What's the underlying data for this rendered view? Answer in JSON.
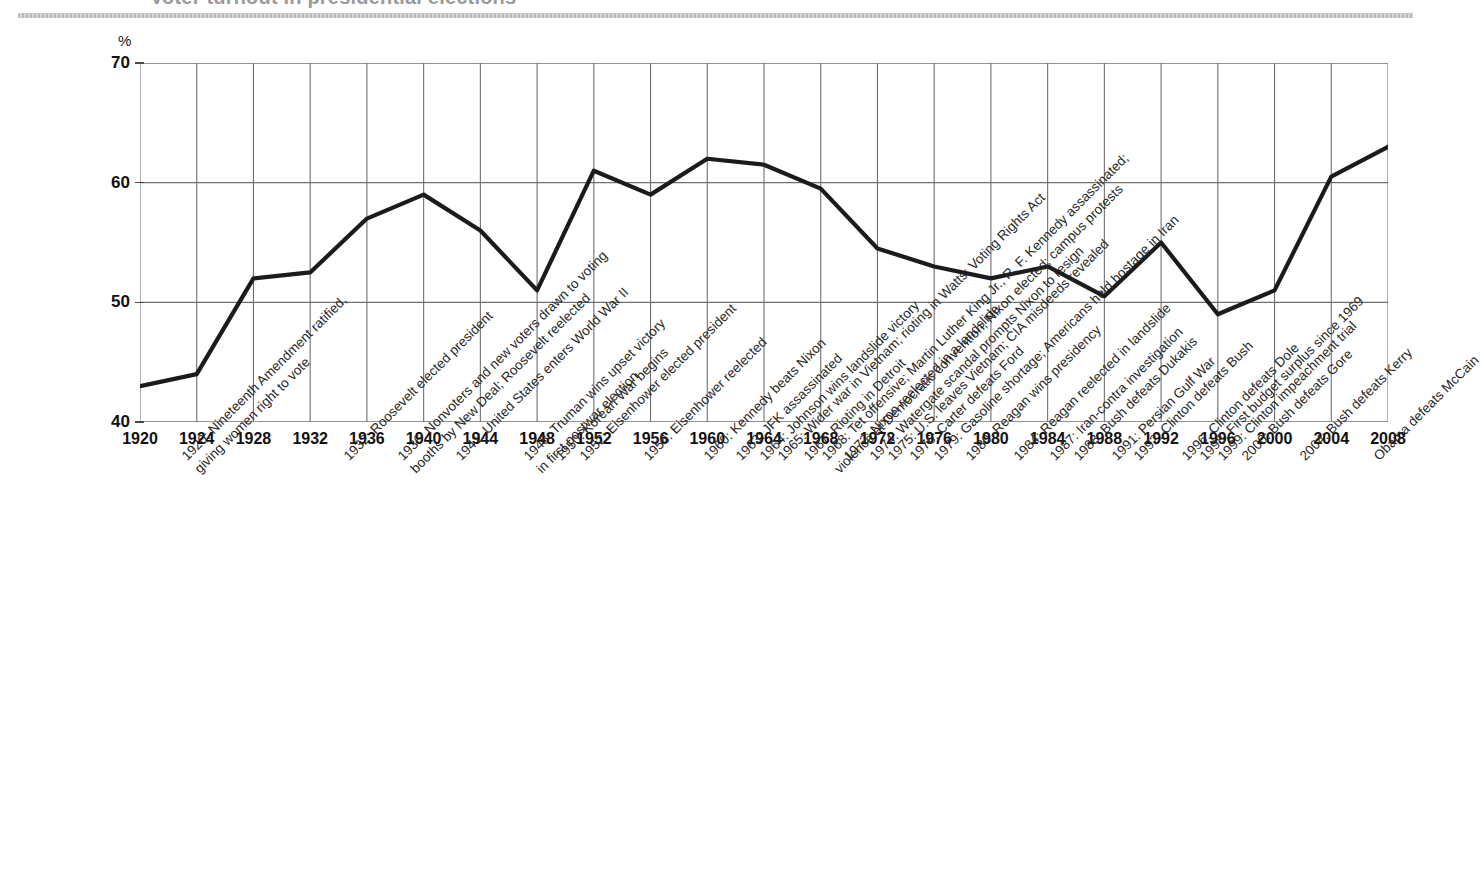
{
  "page": {
    "cut_title": "Voter turnout in presidential elections",
    "y_axis_unit": "%"
  },
  "chart_data": {
    "type": "line",
    "title": "",
    "xlabel": "",
    "ylabel": "%",
    "ylim": [
      40,
      70
    ],
    "yticks": [
      40,
      50,
      60,
      70
    ],
    "grid": true,
    "legend": "none",
    "categories": [
      1920,
      1924,
      1928,
      1932,
      1936,
      1940,
      1944,
      1948,
      1952,
      1956,
      1960,
      1964,
      1968,
      1972,
      1976,
      1980,
      1984,
      1988,
      1992,
      1996,
      2000,
      2004,
      2008
    ],
    "values": [
      43,
      44,
      52,
      52.5,
      57,
      59,
      56,
      51,
      61,
      59,
      62,
      61.5,
      59.5,
      54.5,
      53,
      52,
      53,
      50.5,
      55,
      49,
      51,
      60.5,
      63
    ],
    "series": [
      {
        "name": "Voter turnout",
        "values": [
          43,
          44,
          52,
          52.5,
          57,
          59,
          56,
          51,
          61,
          59,
          62,
          61.5,
          59.5,
          54.5,
          53,
          52,
          53,
          50.5,
          55,
          49,
          51,
          60.5,
          63
        ]
      }
    ],
    "line_color": "#1b1b1b",
    "grid_color": "#6f6f6f"
  },
  "xticks": [
    "1920",
    "1924",
    "1928",
    "1932",
    "1936",
    "1940",
    "1944",
    "1948",
    "1952",
    "1956",
    "1960",
    "1964",
    "1968",
    "1972",
    "1976",
    "1980",
    "1984",
    "1988",
    "1992",
    "1996",
    "2000",
    "2004",
    "2008"
  ],
  "yticks": [
    "70",
    "60",
    "50",
    "40"
  ],
  "annotations": [
    {
      "id": "a1920",
      "line1": "1920: Nineteenth Amendment ratified,",
      "line2": "giving women right to vote"
    },
    {
      "id": "a1932",
      "line1": "1932: Roosevelt elected president",
      "line2": ""
    },
    {
      "id": "a1936",
      "line1": "1936: Nonvoters and new voters drawn to voting",
      "line2": "booths by New Deal; Roosevelt reelected"
    },
    {
      "id": "a1941",
      "line1": "1941: United States enters World War II",
      "line2": ""
    },
    {
      "id": "a1948",
      "line1": "1948: Truman wins upset victory",
      "line2": "in first postwar election"
    },
    {
      "id": "a1950",
      "line1": "1950: Korean War begins",
      "line2": ""
    },
    {
      "id": "a1952",
      "line1": "1952: Eisenhower elected president",
      "line2": ""
    },
    {
      "id": "a1956",
      "line1": "1956: Eisenhower reelected",
      "line2": ""
    },
    {
      "id": "a1960",
      "line1": "1960: Kennedy beats Nixon",
      "line2": ""
    },
    {
      "id": "a1963",
      "line1": "1963: JFK assassinated",
      "line2": ""
    },
    {
      "id": "a1964",
      "line1": "1964: Johnson wins landslide victory",
      "line2": ""
    },
    {
      "id": "a1965",
      "line1": "1965: Wider war in Vietnam; rioting in Watts; Voting Rights Act",
      "line2": ""
    },
    {
      "id": "a1967",
      "line1": "1967: Rioting in Detroit",
      "line2": ""
    },
    {
      "id": "a1968",
      "line1": "1968: Tet offensive; Martin Luther King Jr., R. F. Kennedy assassinated;",
      "line2": "violence at Democratic convention; Nixon elected; campus protests"
    },
    {
      "id": "a1972",
      "line1": "1972: Nixon reelected in a landslide",
      "line2": ""
    },
    {
      "id": "a1974",
      "line1": "1974: Watergate scandal prompts Nixon to resign",
      "line2": ""
    },
    {
      "id": "a1975",
      "line1": "1975: U.S. leaves Vietnam; CIA misdeeds revealed",
      "line2": ""
    },
    {
      "id": "a1976",
      "line1": "1976: Carter defeats Ford",
      "line2": ""
    },
    {
      "id": "a1979",
      "line1": "1979: Gasoline shortage; Americans held hostage in Iran",
      "line2": ""
    },
    {
      "id": "a1980",
      "line1": "1980: Reagan wins presidency",
      "line2": ""
    },
    {
      "id": "a1984",
      "line1": "1984: Reagan reelected in landslide",
      "line2": ""
    },
    {
      "id": "a1987",
      "line1": "1987: Iran-contra investigation",
      "line2": ""
    },
    {
      "id": "a1988",
      "line1": "1988: Bush defeats Dukakis",
      "line2": ""
    },
    {
      "id": "a1991",
      "line1": "1991: Persian Gulf War",
      "line2": ""
    },
    {
      "id": "a1992",
      "line1": "1992: Clinton defeats Bush",
      "line2": ""
    },
    {
      "id": "a1996",
      "line1": "1996: Clinton defeats Dole",
      "line2": ""
    },
    {
      "id": "a1998",
      "line1": "1998: First budget surplus since 1969",
      "line2": ""
    },
    {
      "id": "a1999",
      "line1": "1999: Clinton impeachment trial",
      "line2": ""
    },
    {
      "id": "a2000",
      "line1": "2000: Bush defeats Gore",
      "line2": ""
    },
    {
      "id": "a2004",
      "line1": "2004: Bush defeats Kerry",
      "line2": ""
    },
    {
      "id": "a2008",
      "line1": "Obama defeats McCain",
      "line2": ""
    }
  ]
}
